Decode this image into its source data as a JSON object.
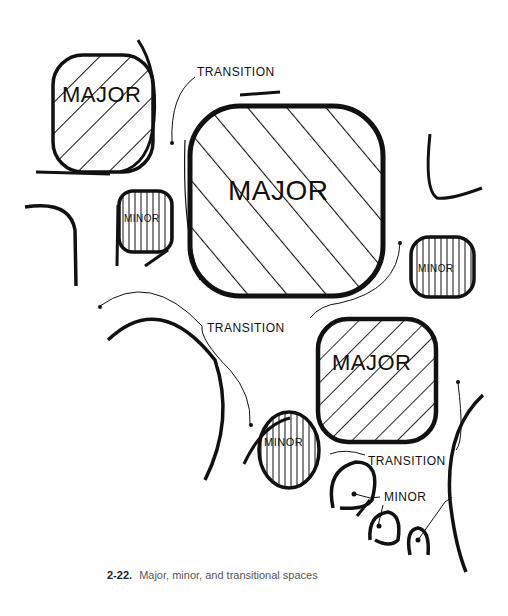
{
  "figure": {
    "number": "2-22.",
    "caption": "Major, minor, and transitional spaces"
  },
  "labels": {
    "major_top_left": "MAJOR",
    "major_center": "MAJOR",
    "major_lower_right": "MAJOR",
    "minor_left": "MINOR",
    "minor_right": "MINOR",
    "minor_bottom": "MINOR",
    "minor_callout": "MINOR",
    "transition_top": "TRANSITION",
    "transition_middle": "TRANSITION",
    "transition_bottom": "TRANSITION"
  },
  "colors": {
    "ink": "#111111",
    "caption": "#555555"
  }
}
